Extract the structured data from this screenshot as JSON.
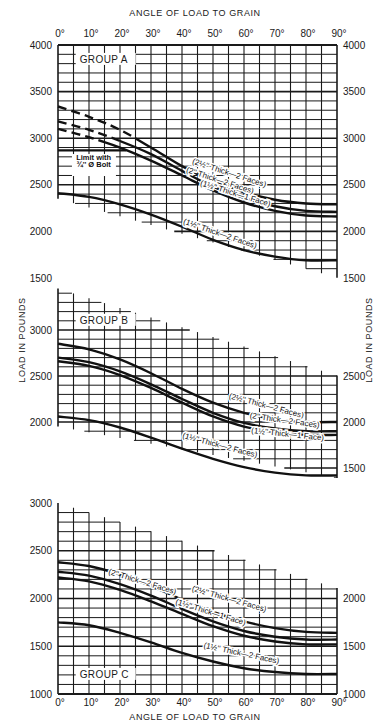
{
  "header": {
    "title_top": "ANGLE OF LOAD TO GRAIN",
    "title_bottom": "ANGLE OF LOAD TO GRAIN"
  },
  "axis": {
    "ylabel": "LOAD IN POUNDS"
  },
  "annotation": {
    "line1": "Limit with",
    "line2": "¾'' Ø Bolt"
  },
  "chart_data": [
    {
      "type": "line",
      "title": "GROUP A",
      "xlabel": "ANGLE OF LOAD TO GRAIN",
      "ylabel": "LOAD IN POUNDS",
      "x": [
        0,
        10,
        20,
        30,
        40,
        50,
        60,
        70,
        80,
        90
      ],
      "x_tick_labels": [
        "0°",
        "10°",
        "20°",
        "30°",
        "40°",
        "50°",
        "60°",
        "70°",
        "80°",
        "90°"
      ],
      "y_ticks": [
        1500,
        2000,
        2500,
        3000,
        3500,
        4000
      ],
      "ylim": [
        1500,
        4000
      ],
      "grid": true,
      "annotations": [
        "Limit with ¾'' Ø Bolt (2870 lb)"
      ],
      "series": [
        {
          "name": "(2½'' Thick—2 Faces)",
          "values": [
            3340,
            3230,
            3090,
            2900,
            2700,
            2540,
            2420,
            2340,
            2300,
            2290
          ],
          "dashed_until_deg": 25
        },
        {
          "name": "(2'' Thick—2 Faces)",
          "values": [
            3180,
            3090,
            2970,
            2830,
            2650,
            2480,
            2360,
            2270,
            2220,
            2210
          ],
          "dashed_until_deg": 20
        },
        {
          "name": "(1½'' Thick—1 Face)",
          "values": [
            3100,
            3010,
            2900,
            2760,
            2600,
            2440,
            2310,
            2220,
            2170,
            2160
          ],
          "dashed_until_deg": 15
        },
        {
          "name": "(1½'' Thick—2 Faces)",
          "values": [
            2410,
            2370,
            2290,
            2180,
            2050,
            1910,
            1800,
            1730,
            1690,
            1690
          ]
        }
      ]
    },
    {
      "type": "line",
      "title": "GROUP B",
      "xlabel": "ANGLE OF LOAD TO GRAIN",
      "ylabel": "LOAD IN POUNDS",
      "x": [
        0,
        10,
        20,
        30,
        40,
        50,
        60,
        70,
        80,
        90
      ],
      "y_ticks": [
        1500,
        2000,
        2500,
        3000
      ],
      "ylim": [
        1400,
        3500
      ],
      "grid": true,
      "series": [
        {
          "name": "(2½'' Thick—2 Faces)",
          "values": [
            2850,
            2790,
            2680,
            2530,
            2360,
            2210,
            2100,
            2030,
            2000,
            2000
          ]
        },
        {
          "name": "(2'' Thick—2 Faces)",
          "values": [
            2700,
            2650,
            2550,
            2410,
            2250,
            2100,
            1990,
            1930,
            1900,
            1900
          ]
        },
        {
          "name": "(1½'' Thick—1 Face)",
          "values": [
            2660,
            2610,
            2510,
            2370,
            2210,
            2060,
            1950,
            1890,
            1860,
            1860
          ]
        },
        {
          "name": "(1½'' Thick—2 Faces)",
          "values": [
            2060,
            2020,
            1940,
            1830,
            1710,
            1600,
            1510,
            1450,
            1420,
            1420
          ]
        }
      ]
    },
    {
      "type": "line",
      "title": "GROUP C",
      "xlabel": "ANGLE OF LOAD TO GRAIN",
      "ylabel": "LOAD IN POUNDS",
      "x": [
        0,
        10,
        20,
        30,
        40,
        50,
        60,
        70,
        80,
        90
      ],
      "x_tick_labels": [
        "0°",
        "10°",
        "20°",
        "30°",
        "40°",
        "50°",
        "60°",
        "70°",
        "80°",
        "90°"
      ],
      "y_ticks": [
        1000,
        1500,
        2000,
        2500,
        3000
      ],
      "ylim": [
        1000,
        3000
      ],
      "grid": true,
      "series": [
        {
          "name": "(2½'' Thick—2 Faces)",
          "values": [
            2380,
            2340,
            2250,
            2130,
            1990,
            1860,
            1760,
            1690,
            1650,
            1640
          ]
        },
        {
          "name": "(2'' Thick—2 Faces)",
          "values": [
            2280,
            2240,
            2150,
            2030,
            1890,
            1760,
            1660,
            1600,
            1570,
            1570
          ]
        },
        {
          "name": "(1½'' Thick—1 Face)",
          "values": [
            2220,
            2180,
            2090,
            1970,
            1840,
            1710,
            1610,
            1550,
            1520,
            1520
          ]
        },
        {
          "name": "(1½'' Thick—2 Faces)",
          "values": [
            1750,
            1720,
            1640,
            1540,
            1430,
            1340,
            1270,
            1230,
            1210,
            1210
          ]
        }
      ]
    }
  ],
  "labels": {
    "a": [
      "(2½'' Thick—2 Faces)",
      "(2'' Thick—2 Faces)",
      "(1½'' Thick—1 Face)",
      "(1½'' Thick—2 Faces)"
    ],
    "b": [
      "(2½'' Thick—2 Faces)",
      "(2'' Thick—2 Faces)",
      "(1½'' Thick—1 Face)",
      "(1½'' Thick—2 Faces)"
    ],
    "c": [
      "(2'' Thick—2 Faces)",
      "(2½'' Thick—2 Faces)",
      "(1½'' Thick—1 Face)",
      "(1½'' Thick—2 Faces)"
    ]
  }
}
